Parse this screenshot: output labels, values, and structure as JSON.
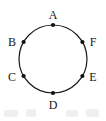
{
  "figure": {
    "background_color": "#ffffff",
    "stroke_color": "#1a1a1a",
    "point_color": "#111111",
    "label_color": "#171717",
    "circle": {
      "cx": 53,
      "cy": 59,
      "r": 34,
      "stroke_width": 1.2
    },
    "points": [
      {
        "label": "A",
        "angle_deg": 90,
        "cx": 53,
        "cy": 25,
        "label_x": 53,
        "label_y": 15,
        "dot_r": 2.1
      },
      {
        "label": "F",
        "angle_deg": 30,
        "cx": 82.4,
        "cy": 42,
        "label_x": 93,
        "label_y": 42,
        "dot_r": 2.1
      },
      {
        "label": "E",
        "angle_deg": -30,
        "cx": 82.4,
        "cy": 76,
        "label_x": 93,
        "label_y": 77,
        "dot_r": 2.1
      },
      {
        "label": "D",
        "angle_deg": -90,
        "cx": 53,
        "cy": 93,
        "label_x": 53,
        "label_y": 105,
        "dot_r": 2.1
      },
      {
        "label": "C",
        "angle_deg": -150,
        "cx": 23.6,
        "cy": 76,
        "label_x": 12,
        "label_y": 77,
        "dot_r": 2.1
      },
      {
        "label": "B",
        "angle_deg": 150,
        "cx": 23.6,
        "cy": 42,
        "label_x": 12,
        "label_y": 42,
        "dot_r": 2.1
      }
    ],
    "artifacts": [
      {
        "x": 4,
        "y": 2,
        "w": 14,
        "h": 7
      },
      {
        "x": 26,
        "y": 1,
        "w": 10,
        "h": 8
      },
      {
        "x": 66,
        "y": 2,
        "w": 12,
        "h": 7
      },
      {
        "x": 86,
        "y": 1,
        "w": 13,
        "h": 8
      }
    ]
  }
}
